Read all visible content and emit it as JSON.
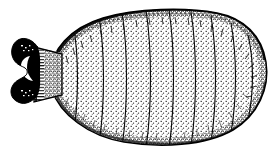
{
  "figure": {
    "title": "Segmented invertebrate dorsal view line drawing",
    "subject_name": "mite-dorsal-habitus",
    "caption": "",
    "background_color": "#ffffff",
    "ink_color": "#000000",
    "stipple_color": "#2a2a2a",
    "width": 277,
    "height": 152,
    "technique": "stipple-and-line pen-and-ink",
    "parts": [
      {
        "id": "gnathosoma",
        "label": "gnathosoma",
        "description": "dark bilobed anterior head structure with white crescent notch opening left",
        "fill": "#000000",
        "bbox": [
          11,
          36,
          28,
          66
        ]
      },
      {
        "id": "neck",
        "label": "neck",
        "description": "trapezoidal striated region joining head to body, fine horizontal striations",
        "fill": "#ffffff",
        "bbox": [
          34,
          44,
          30,
          52
        ]
      },
      {
        "id": "idiosoma",
        "label": "idiosoma",
        "description": "large stippled ovoid body, denser stipple at margins, light at centre",
        "fill": "#ffffff",
        "bbox": [
          50,
          9,
          218,
          136
        ]
      }
    ],
    "body_outline": {
      "left_tip_x": 50,
      "right_tip_x": 268,
      "top_y": 10,
      "bottom_y": 144,
      "center_y": 74
    },
    "segment_lines": {
      "count": 9,
      "x_positions": [
        75,
        100,
        123,
        147,
        170,
        192,
        212,
        232,
        249
      ],
      "note": "transverse dorsal segment divisions, curving convex toward the right"
    },
    "shading": {
      "dark_margin_edge": "upper-left and upper-right dorsal rim",
      "stipple_density_center": "low",
      "stipple_density_margin": "high"
    }
  }
}
